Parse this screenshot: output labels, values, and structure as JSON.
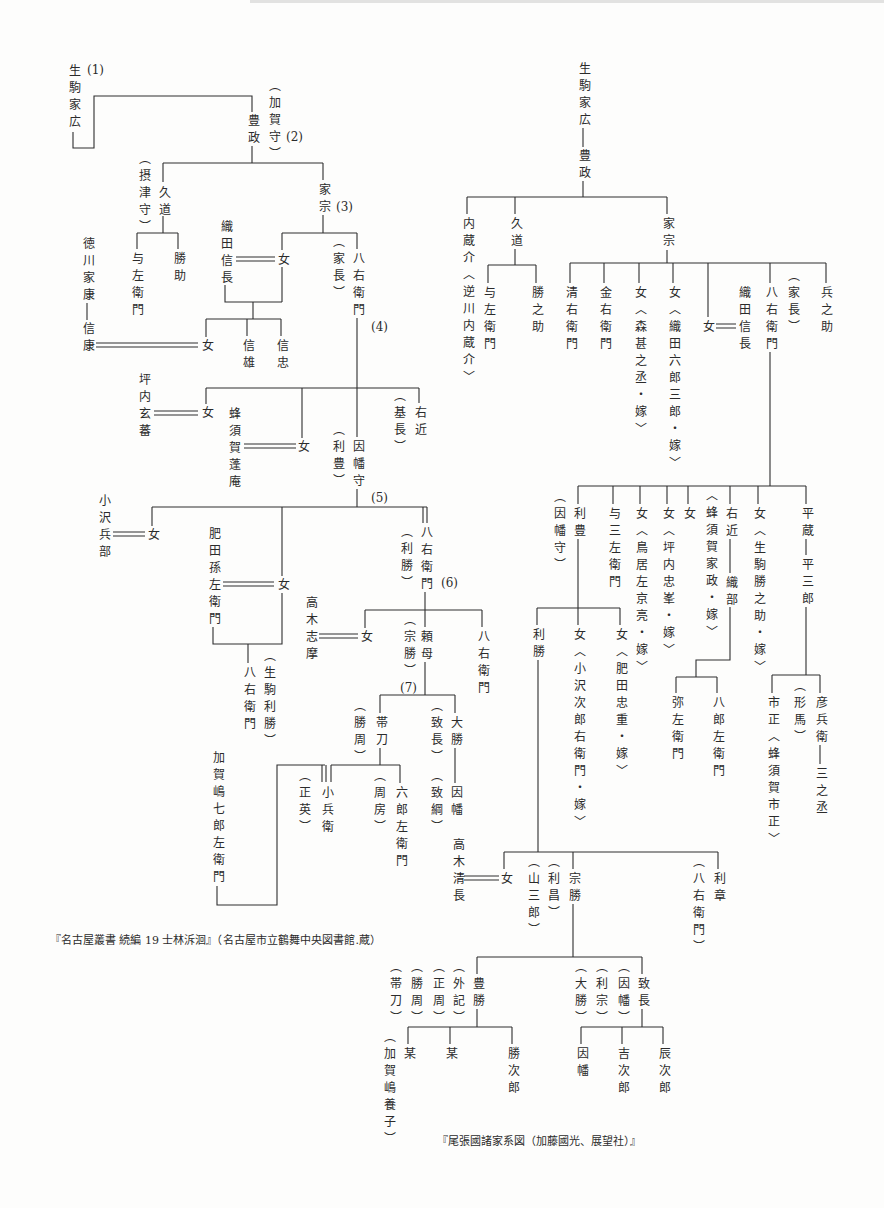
{
  "left_tree": {
    "caption": "『名古屋叢書 続編 19 士林泝洄』（名古屋市立鶴舞中央図書館.蔵）",
    "generation_markers": {
      "g1": "(1)",
      "g2": "(2)",
      "g3": "(3)",
      "g4": "(4)",
      "g5": "(5)",
      "g6": "(6)",
      "g7": "(7)"
    },
    "nodes": {
      "iehiro": "生駒家広",
      "toyomasa": "豊政",
      "toyomasa_title": "（加賀守）",
      "hisamichi": "久道",
      "hisamichi_title": "（摂津守）",
      "yozaemon": "与左衛門",
      "katsusuke": "勝助",
      "iemune": "家宗",
      "oda_nobunaga": "織田信長",
      "iemune_daughter": "女",
      "hachiemon_1": "八右衛門",
      "hachiemon_1_alias": "（家長）",
      "tokugawa_ieyasu": "徳川家康",
      "nobuyasu": "信康",
      "nobunaga_daughter": "女",
      "nobukatsu": "信雄",
      "nobutada": "信忠",
      "tsubouchi_genba": "坪内玄蕃",
      "ienaga_daughter_1": "女",
      "hachisuka_hoan": "蜂須賀蓬庵",
      "ienaga_daughter_2": "女",
      "inaba_no_kami": "因幡守",
      "inaba_no_kami_alias": "（利豊）",
      "ukon": "右近",
      "ukon_alias": "（基長）",
      "ozawa_hyobu": "小沢兵部",
      "toshitoyo_daughter_1": "女",
      "hida_magozaemon": "肥田孫左衛門",
      "toshitoyo_daughter_2": "女",
      "hachiemon_2": "八右衛門",
      "hachiemon_2_alias": "（利勝）",
      "hachiemon_hida": "八右衛門",
      "hachiemon_hida_alias": "（生駒利勝）",
      "takagi_shima": "高木志摩",
      "toshikatsu_daughter": "女",
      "tanomo": "頼母",
      "tanomo_alias": "（宗勝）",
      "hachiemon_3": "八右衛門",
      "tatewaki": "帯刀",
      "tatewaki_alias": "（勝周）",
      "daisho": "大勝",
      "daisho_alias": "（致長）",
      "inaba": "因幡",
      "inaba_alias": "（致綱）",
      "kagashima": "加賀嶋七郎左衛門",
      "kohyoe": "小兵衛",
      "kohyoe_alias": "（正英）",
      "rokurozaemon": "六郎左衛門",
      "rokurozaemon_alias": "（周房）"
    }
  },
  "right_tree": {
    "caption": "『尾張國諸家系図（加藤國光、展望社）』",
    "nodes": {
      "iehiro": "生駒家広",
      "toyomasa": "豊政",
      "kuranosuke": "内蔵介〈逆川内蔵介〉",
      "hisamichi": "久道",
      "yozaemon": "与左衛門",
      "katsunosuke": "勝之助",
      "iemune": "家宗",
      "seiemon": "清右衛門",
      "kinemon": "金右衛門",
      "daughter_mori": "女〈森甚之丞・嫁〉",
      "daughter_oda": "女〈織田六郎三郎・嫁〉",
      "daughter_nobunaga_wife": "女",
      "oda_nobunaga": "織田信長",
      "hachiemon": "八右衛門",
      "hachiemon_alias": "（家長）",
      "hyonosuke": "兵之助",
      "toshitoyo": "利豊",
      "toshitoyo_alias": "（因幡守）",
      "yosozaemon": "与三左衛門",
      "daughter_torii": "女〈鳥居左京亮・嫁〉",
      "daughter_tsubouchi": "女〈坪内忠峯・嫁〉",
      "daughter_hachisuka": "女",
      "daughter_hachisuka_note": "〈蜂須賀家政・嫁〉",
      "ukon": "右近",
      "oribe": "織部",
      "daughter_ikoma": "女〈生駒勝之助・嫁〉",
      "heizo": "平蔵",
      "heizaburo": "平三郎",
      "yazaemon": "弥左衛門",
      "hachirozaemon": "八郎左衛門",
      "ichinokami": "市正〈蜂須賀市正〉",
      "hikobee_alias": "（形馬）",
      "hikobee": "彦兵衛",
      "sannojo": "三之丞",
      "toshikatsu": "利勝",
      "daughter_ozawa": "女〈小沢次郎右衛門・嫁〉",
      "daughter_hida": "女〈肥田忠重・嫁〉",
      "takagi_kiyonaga": "高木清長",
      "daughter_takagi_wife": "女",
      "munekatsu_alias_2": "（山三郎）",
      "munekatsu_alias_1": "（利昌）",
      "munekatsu": "宗勝",
      "toshiaki_alias": "（八右衛門）",
      "toshiaki": "利章",
      "toyokatsu": "豊勝",
      "toyokatsu_alias_1": "（外記）",
      "toyokatsu_alias_2": "（正周）",
      "toyokatsu_alias_3": "（勝周）",
      "toyokatsu_alias_4": "（帯刀）",
      "munenaga": "致長",
      "munenaga_alias_1": "（因幡）",
      "munenaga_alias_2": "（利宗）",
      "munenaga_alias_3": "（大勝）",
      "bo_1": "某",
      "bo_1_alias": "（加賀嶋養子）",
      "bo_2": "某",
      "katsujiro": "勝次郎",
      "inaba": "因幡",
      "kichijiro": "吉次郎",
      "tatsujiro": "辰次郎"
    }
  }
}
